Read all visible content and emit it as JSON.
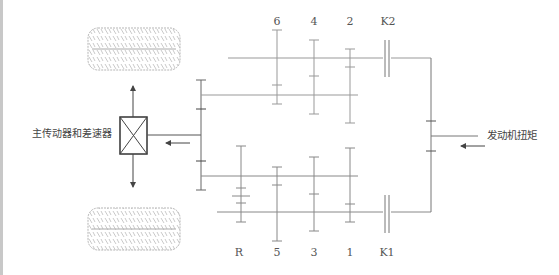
{
  "diagram": {
    "type": "dual-clutch transmission schematic",
    "labels": {
      "differential": "主传动器和差速器",
      "engine_torque": "发动机扭矩"
    },
    "top_gear_labels": [
      "6",
      "4",
      "2",
      "K2"
    ],
    "bottom_gear_labels": [
      "R",
      "5",
      "3",
      "1",
      "K1"
    ],
    "colors": {
      "line": "#8a8a8a",
      "dark_line": "#555555",
      "tire": "#aaaaaa",
      "edge_strip": "#c8c8c8"
    },
    "components": [
      {
        "id": "tire-top",
        "kind": "wheel"
      },
      {
        "id": "tire-bottom",
        "kind": "wheel"
      },
      {
        "id": "differential-box",
        "kind": "final-drive-and-differential"
      },
      {
        "id": "clutch-k1",
        "kind": "clutch",
        "label": "K1"
      },
      {
        "id": "clutch-k2",
        "kind": "clutch",
        "label": "K2"
      }
    ]
  }
}
